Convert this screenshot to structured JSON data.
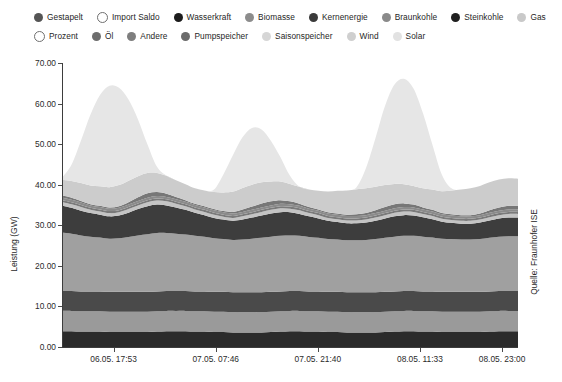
{
  "legend": {
    "rows": [
      [
        {
          "label": "Gestapelt",
          "color": "#555555",
          "style": "filled"
        },
        {
          "label": "Import Saldo",
          "color": "#ffffff",
          "style": "hollow"
        },
        {
          "label": "Wasserkraft",
          "color": "#1c1c1c",
          "style": "filled"
        },
        {
          "label": "Biomasse",
          "color": "#8c8c8c",
          "style": "filled"
        },
        {
          "label": "Kernenergie",
          "color": "#3a3a3a",
          "style": "filled"
        },
        {
          "label": "Braunkohle",
          "color": "#8a8a8a",
          "style": "filled"
        },
        {
          "label": "Steinkohle",
          "color": "#1f1f1f",
          "style": "filled"
        },
        {
          "label": "Gas",
          "color": "#c9c9c9",
          "style": "filled"
        }
      ],
      [
        {
          "label": "Prozent",
          "color": "#ffffff",
          "style": "hollow"
        },
        {
          "label": "Öl",
          "color": "#6d6d6d",
          "style": "filled"
        },
        {
          "label": "Andere",
          "color": "#7e7e7e",
          "style": "filled"
        },
        {
          "label": "Pumpspeicher",
          "color": "#6b6b6b",
          "style": "filled"
        },
        {
          "label": "Saisonspeicher",
          "color": "#d6d6d6",
          "style": "filled"
        },
        {
          "label": "Wind",
          "color": "#cfcfcf",
          "style": "filled"
        },
        {
          "label": "Solar",
          "color": "#e2e2e2",
          "style": "filled"
        }
      ]
    ]
  },
  "chart_data": {
    "type": "area",
    "title": "",
    "xlabel": "",
    "ylabel": "Leistung (GW)",
    "ylim": [
      0,
      70
    ],
    "yticks": [
      "0.00",
      "10.00",
      "20.00",
      "30.00",
      "40.00",
      "50.00",
      "60.00",
      "70.00"
    ],
    "ytick_values": [
      0,
      10,
      20,
      30,
      40,
      50,
      60,
      70
    ],
    "grid": false,
    "legend_position": "top",
    "source": "Quelle: Fraunhofer ISE",
    "xtick_labels": [
      "06.05.  17:53",
      "07.05.  07:46",
      "07.05.  21:40",
      "08.05.  11:33",
      "08.05.  23:00"
    ],
    "xtick_positions": [
      0.113,
      0.337,
      0.561,
      0.785,
      0.965
    ],
    "x": [
      0,
      1,
      2,
      3,
      4,
      5,
      6,
      7,
      8,
      9,
      10,
      11,
      12,
      13,
      14,
      15,
      16,
      17,
      18,
      19,
      20,
      21,
      22,
      23,
      24,
      25,
      26,
      27,
      28,
      29,
      30,
      31,
      32,
      33,
      34,
      35,
      36,
      37,
      38,
      39,
      40,
      41,
      42,
      43,
      44,
      45,
      46,
      47,
      48
    ],
    "series": [
      {
        "name": "Wasserkraft",
        "color": "#2b2b2b",
        "values": [
          3.9,
          3.9,
          3.8,
          3.8,
          3.8,
          3.7,
          3.7,
          3.7,
          3.7,
          3.7,
          3.8,
          3.9,
          3.9,
          3.9,
          3.8,
          3.8,
          3.7,
          3.7,
          3.6,
          3.6,
          3.6,
          3.6,
          3.7,
          3.8,
          3.9,
          3.9,
          3.8,
          3.8,
          3.7,
          3.7,
          3.6,
          3.6,
          3.6,
          3.6,
          3.7,
          3.8,
          3.9,
          3.9,
          3.8,
          3.8,
          3.7,
          3.7,
          3.7,
          3.7,
          3.7,
          3.8,
          3.9,
          3.9,
          3.9
        ]
      },
      {
        "name": "Biomasse",
        "color": "#9a9a9a",
        "values": [
          5.0,
          5.0,
          5.0,
          5.0,
          5.0,
          5.0,
          5.0,
          5.0,
          5.0,
          5.0,
          5.0,
          5.0,
          5.0,
          5.0,
          5.0,
          5.0,
          5.0,
          5.0,
          5.0,
          5.0,
          5.0,
          5.0,
          5.0,
          5.0,
          5.0,
          5.0,
          5.0,
          5.0,
          5.0,
          5.0,
          5.0,
          5.0,
          5.0,
          5.0,
          5.0,
          5.0,
          5.0,
          5.0,
          5.0,
          5.0,
          5.0,
          5.0,
          5.0,
          5.0,
          5.0,
          5.0,
          5.0,
          5.0,
          5.0
        ]
      },
      {
        "name": "Kernenergie",
        "color": "#4a4a4a",
        "values": [
          4.9,
          4.9,
          4.9,
          4.9,
          4.9,
          4.9,
          4.9,
          4.9,
          4.9,
          4.9,
          4.9,
          4.9,
          4.9,
          4.9,
          4.9,
          4.9,
          4.9,
          4.9,
          4.9,
          4.9,
          4.9,
          4.9,
          4.9,
          4.9,
          4.9,
          4.9,
          4.9,
          4.9,
          4.9,
          4.9,
          4.9,
          4.9,
          4.9,
          4.9,
          4.9,
          4.9,
          4.9,
          4.9,
          4.9,
          4.9,
          4.9,
          4.9,
          4.9,
          4.9,
          4.9,
          4.9,
          4.9,
          4.9,
          4.9
        ]
      },
      {
        "name": "Braunkohle",
        "color": "#a0a0a0",
        "values": [
          14.4,
          14.1,
          13.8,
          13.5,
          13.3,
          13.1,
          13.2,
          13.5,
          13.9,
          14.2,
          14.4,
          14.3,
          14.1,
          13.9,
          13.7,
          13.5,
          13.2,
          13.0,
          12.9,
          13.0,
          13.2,
          13.4,
          13.6,
          13.7,
          13.7,
          13.6,
          13.4,
          13.2,
          13.0,
          12.9,
          12.8,
          12.8,
          12.9,
          13.1,
          13.3,
          13.5,
          13.6,
          13.6,
          13.5,
          13.3,
          13.1,
          13.0,
          12.9,
          12.9,
          13.0,
          13.2,
          13.4,
          13.5,
          13.5
        ]
      },
      {
        "name": "Steinkohle",
        "color": "#3d3d3d",
        "values": [
          6.6,
          6.4,
          6.1,
          5.8,
          5.6,
          5.5,
          5.6,
          6.0,
          6.5,
          6.9,
          7.0,
          6.8,
          6.5,
          6.1,
          5.7,
          5.3,
          5.0,
          4.8,
          4.7,
          4.9,
          5.2,
          5.5,
          5.7,
          5.8,
          5.7,
          5.4,
          5.1,
          4.8,
          4.5,
          4.3,
          4.2,
          4.2,
          4.3,
          4.5,
          4.8,
          5.0,
          5.1,
          5.0,
          4.8,
          4.5,
          4.2,
          4.0,
          3.9,
          3.9,
          4.1,
          4.3,
          4.5,
          4.6,
          4.6
        ]
      },
      {
        "name": "Gas",
        "color": "#c4c4c4",
        "values": [
          0.9,
          0.9,
          0.9,
          0.8,
          0.8,
          0.8,
          0.8,
          0.9,
          0.9,
          1.0,
          1.0,
          1.0,
          0.9,
          0.9,
          0.8,
          0.8,
          0.8,
          0.7,
          0.7,
          0.8,
          0.8,
          0.9,
          0.9,
          1.0,
          0.9,
          0.9,
          0.8,
          0.8,
          0.7,
          0.7,
          0.7,
          0.7,
          0.7,
          0.8,
          0.8,
          0.9,
          0.9,
          0.9,
          0.8,
          0.8,
          0.7,
          0.7,
          0.7,
          0.7,
          0.7,
          0.8,
          0.8,
          0.9,
          0.9
        ]
      },
      {
        "name": "Öl",
        "color": "#7a7a7a",
        "values": [
          0.5,
          0.5,
          0.5,
          0.5,
          0.5,
          0.5,
          0.5,
          0.5,
          0.5,
          0.5,
          0.5,
          0.5,
          0.5,
          0.5,
          0.5,
          0.5,
          0.5,
          0.5,
          0.5,
          0.5,
          0.5,
          0.5,
          0.5,
          0.5,
          0.5,
          0.5,
          0.5,
          0.5,
          0.5,
          0.5,
          0.5,
          0.5,
          0.5,
          0.5,
          0.5,
          0.5,
          0.5,
          0.5,
          0.5,
          0.5,
          0.5,
          0.5,
          0.5,
          0.5,
          0.5,
          0.5,
          0.5,
          0.5,
          0.5
        ]
      },
      {
        "name": "Andere",
        "color": "#8b8b8b",
        "values": [
          0.6,
          0.6,
          0.6,
          0.6,
          0.6,
          0.6,
          0.6,
          0.6,
          0.6,
          0.6,
          0.6,
          0.6,
          0.6,
          0.6,
          0.6,
          0.6,
          0.6,
          0.6,
          0.6,
          0.6,
          0.6,
          0.6,
          0.6,
          0.6,
          0.6,
          0.6,
          0.6,
          0.6,
          0.6,
          0.6,
          0.6,
          0.6,
          0.6,
          0.6,
          0.6,
          0.6,
          0.6,
          0.6,
          0.6,
          0.6,
          0.6,
          0.6,
          0.6,
          0.6,
          0.6,
          0.6,
          0.6,
          0.6,
          0.6
        ]
      },
      {
        "name": "Pumpspeicher",
        "color": "#777777",
        "values": [
          0.6,
          0.5,
          0.4,
          0.3,
          0.3,
          0.3,
          0.4,
          0.6,
          0.9,
          1.1,
          1.0,
          0.8,
          0.6,
          0.4,
          0.3,
          0.3,
          0.3,
          0.3,
          0.4,
          0.6,
          0.8,
          1.0,
          1.0,
          0.9,
          0.7,
          0.5,
          0.4,
          0.3,
          0.3,
          0.3,
          0.3,
          0.4,
          0.5,
          0.7,
          0.9,
          1.0,
          0.9,
          0.7,
          0.5,
          0.4,
          0.3,
          0.3,
          0.3,
          0.3,
          0.4,
          0.6,
          0.8,
          0.9,
          0.9
        ]
      },
      {
        "name": "Wind",
        "color": "#cccccc",
        "values": [
          3.8,
          4.1,
          4.4,
          4.6,
          4.8,
          5.0,
          5.2,
          5.3,
          5.2,
          5.0,
          4.7,
          4.4,
          4.1,
          3.9,
          3.8,
          3.9,
          4.2,
          4.6,
          5.0,
          5.3,
          5.4,
          5.2,
          4.9,
          4.6,
          4.3,
          4.2,
          4.3,
          4.6,
          5.1,
          5.6,
          6.0,
          6.2,
          6.1,
          5.8,
          5.4,
          5.0,
          4.7,
          4.6,
          4.7,
          5.0,
          5.4,
          5.9,
          6.3,
          6.6,
          6.8,
          6.9,
          6.9,
          6.8,
          6.7
        ]
      },
      {
        "name": "Solar",
        "color": "#e6e6e6",
        "values": [
          0.5,
          4.0,
          10.5,
          17.5,
          22.5,
          25.0,
          24.0,
          20.0,
          14.0,
          7.0,
          1.5,
          0.0,
          0.0,
          0.0,
          0.0,
          0.0,
          0.6,
          4.5,
          9.0,
          12.5,
          14.0,
          13.0,
          10.0,
          6.0,
          2.0,
          0.0,
          0.0,
          0.0,
          0.0,
          0.0,
          0.0,
          0.5,
          5.0,
          12.0,
          19.5,
          24.5,
          26.0,
          24.0,
          18.5,
          11.0,
          4.0,
          0.5,
          0.0,
          0.0,
          0.0,
          0.0,
          0.0,
          0.0,
          0.0
        ]
      }
    ],
    "peaks_gw": [
      68.4,
      61.5,
      66.0
    ],
    "baseline_total_gw": 36.0,
    "max_total_gw": 68.4
  }
}
